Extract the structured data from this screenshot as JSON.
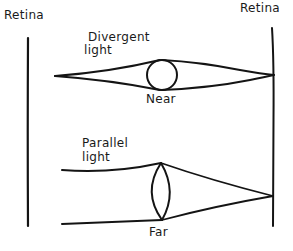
{
  "diagram": {
    "type": "eye-accommodation",
    "ink_color": "#141414",
    "background": "#ffffff",
    "labels": {
      "retina_left": "Retina",
      "retina_right": "Retina",
      "top_light_line1": "Divergent",
      "top_light_line2": "light",
      "top_lens": "Near",
      "bottom_light_line1": "Parallel",
      "bottom_light_line2": "light",
      "bottom_lens": "Far"
    },
    "elements": {
      "retina_left_line": {
        "x": 28,
        "y1": 38,
        "y2": 226
      },
      "retina_right_line": {
        "x": 273,
        "y1": 28,
        "y2": 226
      },
      "near_scenario": {
        "light_source": [
          55,
          76
        ],
        "lens_shape": "circle",
        "lens_center": [
          162,
          75
        ],
        "lens_radius": 15,
        "focus_point": [
          274,
          75
        ]
      },
      "far_scenario": {
        "ray_start_x": 62,
        "ray_top_y": 170,
        "ray_bottom_y": 224,
        "lens_shape": "biconvex",
        "lens_top": [
          161,
          163
        ],
        "lens_bottom": [
          162,
          220
        ],
        "focus_point": [
          273,
          196
        ]
      }
    }
  }
}
